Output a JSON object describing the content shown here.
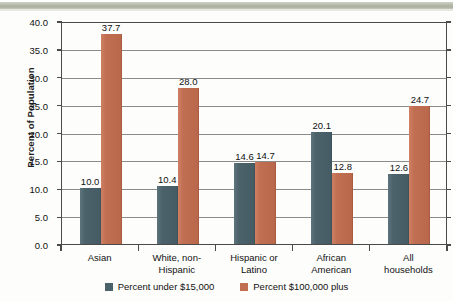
{
  "banner": {
    "color": "#b4b8a8"
  },
  "chart_data": {
    "type": "bar",
    "title": "",
    "xlabel": "",
    "ylabel": "Percent of Population",
    "ylim": [
      0,
      40
    ],
    "ytick_labels": [
      "40.0",
      "35.0",
      "30.0",
      "25.0",
      "20.0",
      "15.0",
      "10.0",
      "5.0",
      "0.0"
    ],
    "ytick_values": [
      40,
      35,
      30,
      25,
      20,
      15,
      10,
      5,
      0
    ],
    "grid": true,
    "legend_position": "bottom",
    "categories": [
      "Asian",
      "White, non-\nHispanic",
      "Hispanic or\nLatino",
      "African\nAmerican",
      "All households"
    ],
    "series": [
      {
        "name": "Percent under $15,000",
        "color": "#4c626b",
        "values": [
          10.0,
          10.4,
          14.6,
          20.1,
          12.6
        ],
        "labels": [
          "10.0",
          "10.4",
          "14.6",
          "20.1",
          "12.6"
        ]
      },
      {
        "name": "Percent $100,000 plus",
        "color": "#c06f52",
        "values": [
          37.7,
          28.0,
          14.7,
          12.8,
          24.7
        ],
        "labels": [
          "37.7",
          "28.0",
          "14.7",
          "12.8",
          "24.7"
        ]
      }
    ]
  }
}
